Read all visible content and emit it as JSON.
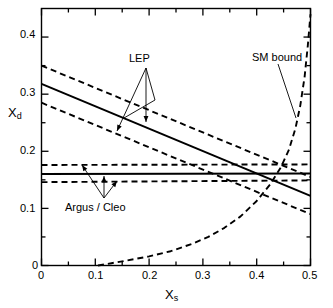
{
  "figure": {
    "background": "#ffffff",
    "foreground": "#000000"
  },
  "axes": {
    "x": {
      "label": "X",
      "label_sub": "s",
      "min": 0,
      "max": 0.5,
      "ticks": [
        0,
        0.1,
        0.2,
        0.3,
        0.4,
        0.5
      ],
      "tick_labels": [
        "0",
        "0.1",
        "0.2",
        "0.3",
        "0.4",
        "0.5"
      ],
      "minor_ticks": [
        0.05,
        0.15,
        0.25,
        0.35,
        0.45
      ]
    },
    "y": {
      "label": "X",
      "label_sub": "d",
      "min": 0,
      "max": 0.45,
      "ticks": [
        0,
        0.1,
        0.2,
        0.3,
        0.4
      ],
      "tick_labels": [
        "0",
        "0.1",
        "0.2",
        "0.3",
        "0.4"
      ],
      "minor_ticks": [
        0.05,
        0.15,
        0.25,
        0.35
      ]
    },
    "frame": true,
    "grid": false
  },
  "annotations": [
    {
      "name": "lep",
      "text": "LEP",
      "x": 0.168,
      "y": 0.329
    },
    {
      "name": "argus-cleo",
      "text": "Argus / Cleo",
      "x": 0.166,
      "y": 0.119
    },
    {
      "name": "sm-bound",
      "text": "SM bound",
      "x": 0.425,
      "y": 0.4
    }
  ],
  "chart_data": {
    "type": "line",
    "title": "",
    "xlabel": "X_s",
    "ylabel": "X_d",
    "xlim": [
      0,
      0.5
    ],
    "ylim": [
      0,
      0.45
    ],
    "grid": false,
    "legend": "none (inline text annotations)",
    "series": [
      {
        "name": "LEP central",
        "style": "solid",
        "comment": "LEP allowed band central value, sloping down",
        "x": [
          0.0,
          0.5
        ],
        "y": [
          0.318,
          0.122
        ]
      },
      {
        "name": "LEP upper",
        "style": "dashed",
        "comment": "LEP band upper limit",
        "x": [
          0.0,
          0.5
        ],
        "y": [
          0.35,
          0.155
        ]
      },
      {
        "name": "LEP lower",
        "style": "dashed",
        "comment": "LEP band lower limit",
        "x": [
          0.0,
          0.5
        ],
        "y": [
          0.285,
          0.09
        ]
      },
      {
        "name": "Argus/Cleo central",
        "style": "solid",
        "comment": "horizontal central value",
        "x": [
          0.0,
          0.5
        ],
        "y": [
          0.16,
          0.161
        ]
      },
      {
        "name": "Argus/Cleo upper",
        "style": "dashed",
        "comment": "horizontal upper limit",
        "x": [
          0.0,
          0.5
        ],
        "y": [
          0.176,
          0.177
        ]
      },
      {
        "name": "Argus/Cleo lower",
        "style": "dashed",
        "comment": "horizontal lower limit",
        "x": [
          0.0,
          0.5
        ],
        "y": [
          0.146,
          0.149
        ]
      },
      {
        "name": "SM bound",
        "style": "dashed",
        "comment": "steeply rising boundary curve from (0.105,0) to (0.5,0.44)",
        "x": [
          0.105,
          0.13,
          0.16,
          0.2,
          0.24,
          0.28,
          0.31,
          0.34,
          0.37,
          0.4,
          0.425,
          0.445,
          0.46,
          0.472,
          0.481,
          0.489,
          0.495,
          0.5
        ],
        "y": [
          0.0,
          0.004,
          0.009,
          0.016,
          0.025,
          0.038,
          0.05,
          0.066,
          0.086,
          0.113,
          0.142,
          0.172,
          0.203,
          0.24,
          0.28,
          0.33,
          0.385,
          0.44
        ]
      }
    ]
  }
}
